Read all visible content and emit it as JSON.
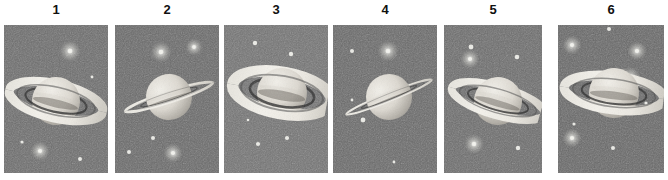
{
  "figure": {
    "panel_count": 6,
    "background_color": "#ffffff",
    "sky_color": "#6b6b6b",
    "planet_light": "#f2f0ea",
    "planet_shadow": "#8d8a84",
    "ring_color": "#f4f2ec",
    "ring_shadow": "#4a4a4a",
    "label_color": "#101010",
    "star_color": "#f5f5f0"
  },
  "panels": [
    {
      "label": "1",
      "name": "saturn-panel-1",
      "x": 4,
      "y": 25,
      "width": 104,
      "height": 148,
      "sky_tone": "#6d6d6d",
      "ring_tilt_deg": 13,
      "ring_openness": 0.3,
      "ring_view": "slightly-open-from-above",
      "planet_cx": 52,
      "planet_cy": 76,
      "planet_r": 24,
      "ring_rx": 47,
      "ring_ry": 13,
      "stars": [
        {
          "x": 66,
          "y": 26,
          "r": 5.5,
          "glow": true
        },
        {
          "x": 18,
          "y": 117,
          "r": 1.6,
          "glow": false
        },
        {
          "x": 36,
          "y": 126,
          "r": 5.0,
          "glow": true
        },
        {
          "x": 76,
          "y": 134,
          "r": 2.0,
          "glow": false
        },
        {
          "x": 88,
          "y": 52,
          "r": 1.4,
          "glow": false
        }
      ]
    },
    {
      "label": "2",
      "name": "saturn-panel-2",
      "x": 115,
      "y": 25,
      "width": 104,
      "height": 148,
      "sky_tone": "#6a6a6a",
      "ring_tilt_deg": -18,
      "ring_openness": 0.06,
      "ring_view": "nearly-edge-on",
      "planet_cx": 54,
      "planet_cy": 72,
      "planet_r": 23,
      "ring_rx": 52,
      "ring_ry": 4,
      "stars": [
        {
          "x": 46,
          "y": 27,
          "r": 5.5,
          "glow": true
        },
        {
          "x": 79,
          "y": 22,
          "r": 4.5,
          "glow": true
        },
        {
          "x": 38,
          "y": 113,
          "r": 2.0,
          "glow": false
        },
        {
          "x": 14,
          "y": 127,
          "r": 2.0,
          "glow": false
        },
        {
          "x": 58,
          "y": 128,
          "r": 5.0,
          "glow": true
        }
      ]
    },
    {
      "label": "3",
      "name": "saturn-panel-3",
      "x": 224,
      "y": 25,
      "width": 104,
      "height": 148,
      "sky_tone": "#747474",
      "ring_tilt_deg": 10,
      "ring_openness": 0.38,
      "ring_view": "open-from-above",
      "planet_cx": 58,
      "planet_cy": 68,
      "planet_r": 25,
      "ring_rx": 50,
      "ring_ry": 16,
      "stars": [
        {
          "x": 31,
          "y": 18,
          "r": 2.2,
          "glow": false
        },
        {
          "x": 67,
          "y": 29,
          "r": 2.2,
          "glow": false
        },
        {
          "x": 24,
          "y": 95,
          "r": 1.3,
          "glow": false
        },
        {
          "x": 63,
          "y": 113,
          "r": 2.1,
          "glow": false
        },
        {
          "x": 34,
          "y": 119,
          "r": 2.1,
          "glow": false
        }
      ]
    },
    {
      "label": "4",
      "name": "saturn-panel-4",
      "x": 333,
      "y": 25,
      "width": 104,
      "height": 148,
      "sky_tone": "#6a6a6a",
      "ring_tilt_deg": -22,
      "ring_openness": 0.05,
      "ring_view": "edge-on",
      "planet_cx": 56,
      "planet_cy": 72,
      "planet_r": 23,
      "ring_rx": 54,
      "ring_ry": 3,
      "stars": [
        {
          "x": 19,
          "y": 26,
          "r": 2.0,
          "glow": false
        },
        {
          "x": 55,
          "y": 26,
          "r": 5.5,
          "glow": true
        },
        {
          "x": 19,
          "y": 75,
          "r": 1.4,
          "glow": false
        },
        {
          "x": 30,
          "y": 95,
          "r": 2.4,
          "glow": false
        },
        {
          "x": 61,
          "y": 137,
          "r": 1.4,
          "glow": false
        }
      ]
    },
    {
      "label": "5",
      "name": "saturn-panel-5",
      "x": 444,
      "y": 25,
      "width": 98,
      "height": 148,
      "sky_tone": "#6d6d6d",
      "ring_tilt_deg": 16,
      "ring_openness": 0.26,
      "ring_view": "slightly-open",
      "planet_cx": 54,
      "planet_cy": 76,
      "planet_r": 24,
      "ring_rx": 49,
      "ring_ry": 11,
      "stars": [
        {
          "x": 27,
          "y": 22,
          "r": 2.4,
          "glow": false
        },
        {
          "x": 73,
          "y": 32,
          "r": 2.3,
          "glow": false
        },
        {
          "x": 26,
          "y": 34,
          "r": 5.0,
          "glow": true
        },
        {
          "x": 30,
          "y": 119,
          "r": 5.2,
          "glow": true
        },
        {
          "x": 74,
          "y": 123,
          "r": 2.2,
          "glow": false
        }
      ]
    },
    {
      "label": "6",
      "name": "saturn-panel-6",
      "x": 558,
      "y": 25,
      "width": 106,
      "height": 148,
      "sky_tone": "#686868",
      "ring_tilt_deg": 7,
      "ring_openness": 0.33,
      "ring_view": "open-wide",
      "planet_cx": 56,
      "planet_cy": 68,
      "planet_r": 25,
      "ring_rx": 54,
      "ring_ry": 13,
      "stars": [
        {
          "x": 51,
          "y": 4,
          "r": 2.0,
          "glow": false
        },
        {
          "x": 14,
          "y": 20,
          "r": 5.0,
          "glow": true
        },
        {
          "x": 79,
          "y": 26,
          "r": 5.0,
          "glow": true
        },
        {
          "x": 72,
          "y": 52,
          "r": 5.5,
          "glow": true
        },
        {
          "x": 16,
          "y": 99,
          "r": 1.6,
          "glow": false
        },
        {
          "x": 88,
          "y": 78,
          "r": 1.6,
          "glow": false
        },
        {
          "x": 14,
          "y": 113,
          "r": 5.0,
          "glow": true
        },
        {
          "x": 55,
          "y": 123,
          "r": 2.0,
          "glow": false
        }
      ]
    }
  ]
}
